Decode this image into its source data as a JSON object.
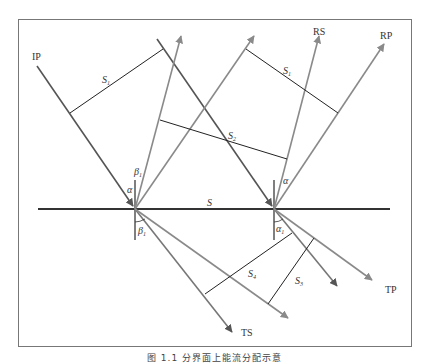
{
  "figure": {
    "caption": "图 1.1   分界面上能流分配示意",
    "colors": {
      "frame": "#666666",
      "incident": "#555555",
      "ray_gray": "#8a8a8a",
      "wavefront": "#222222",
      "interface": "#333333"
    },
    "labels": {
      "incident_p": "IP",
      "reflected_s": "RS",
      "reflected_p": "RP",
      "transmitted_s": "TS",
      "transmitted_p": "TP",
      "interface": "S",
      "s1_left": "S",
      "s1_left_sub": "1",
      "s1_right": "S",
      "s1_right_sub": "1",
      "s2": "S",
      "s2_sub": "2",
      "s3": "S",
      "s3_sub": "3",
      "s4": "S",
      "s4_sub": "4",
      "alpha_left": "α",
      "beta1_upper": "β",
      "beta1_upper_sub": "1",
      "beta1_lower": "β",
      "beta1_lower_sub": "1",
      "alpha_right": "α",
      "alpha1_lower": "α",
      "alpha1_lower_sub": "1"
    }
  }
}
